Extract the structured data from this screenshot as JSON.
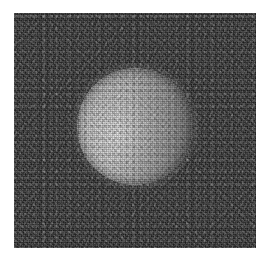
{
  "figure": {
    "kind": "grayscale-astronomical-image",
    "title": "",
    "caption": "",
    "canvas": {
      "width": 272,
      "height": 263,
      "background": "#ffffff"
    },
    "frame": {
      "name": "image-frame",
      "x": 14,
      "y": 13,
      "width": 242,
      "height": 235,
      "background_color": "#242424",
      "noise": "dark-grain"
    },
    "disk": {
      "name": "bright-disk",
      "center_x": 135,
      "center_y": 126,
      "radius": 58,
      "width": 116,
      "height": 117,
      "highlight_color": "#e0e0e0",
      "midtone_color": "#b8b8b8",
      "shadow_color": "#8e8e8e",
      "highlight_offset_x": "36%",
      "highlight_offset_y": "58%",
      "texture": "bright-grain"
    },
    "palette": {
      "page_background": "#ffffff",
      "field_dark": "#242424",
      "field_darkest": "#141414",
      "disk_bright": "#e4e4e4",
      "disk_mid": "#b4b4b4",
      "disk_dim": "#8a8a8a"
    }
  }
}
